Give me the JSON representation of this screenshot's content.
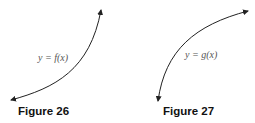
{
  "figures": [
    {
      "caption": "Figure 26",
      "curve_label": "y = f(x)",
      "shape": "concave-up increasing"
    },
    {
      "caption": "Figure 27",
      "curve_label": "y = g(x)",
      "shape": "concave-down increasing"
    }
  ],
  "colors": {
    "curve": "#222222",
    "label": "#555555",
    "caption": "#111111"
  }
}
